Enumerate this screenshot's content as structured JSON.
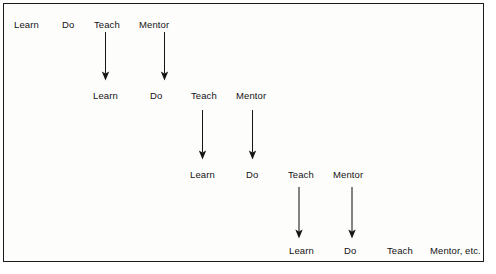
{
  "diagram": {
    "background_color": "#fdfdfc",
    "border_color": "#1b1b1b",
    "text_color": "#141414",
    "arrow_color": "#151515",
    "stage": {
      "width": 496,
      "height": 274
    },
    "frame": {
      "x": 3,
      "y": 3,
      "width": 481,
      "height": 259
    },
    "rows": [
      {
        "index": 1,
        "y": 19,
        "nodes": [
          {
            "label": "Learn",
            "x": 14
          },
          {
            "label": "Do",
            "x": 62
          },
          {
            "label": "Teach",
            "x": 94
          },
          {
            "label": "Mentor",
            "x": 139
          }
        ]
      },
      {
        "index": 2,
        "y": 90,
        "nodes": [
          {
            "label": "Learn",
            "x": 93
          },
          {
            "label": "Do",
            "x": 150
          },
          {
            "label": "Teach",
            "x": 191
          },
          {
            "label": "Mentor",
            "x": 236
          }
        ]
      },
      {
        "index": 3,
        "y": 169,
        "nodes": [
          {
            "label": "Learn",
            "x": 190
          },
          {
            "label": "Do",
            "x": 246
          },
          {
            "label": "Teach",
            "x": 288
          },
          {
            "label": "Mentor",
            "x": 333
          }
        ]
      },
      {
        "index": 4,
        "y": 245,
        "nodes": [
          {
            "label": "Learn",
            "x": 289
          },
          {
            "label": "Do",
            "x": 344
          },
          {
            "label": "Teach",
            "x": 387
          },
          {
            "label": "Mentor, etc.",
            "x": 430
          }
        ]
      }
    ],
    "arrows": [
      {
        "from": "row1-teach",
        "to": "row2-learn",
        "x": 105.5,
        "y1": 32,
        "y2": 80
      },
      {
        "from": "row1-mentor",
        "to": "row2-do",
        "x": 164.5,
        "y1": 32,
        "y2": 80
      },
      {
        "from": "row2-teach",
        "to": "row3-learn",
        "x": 202.5,
        "y1": 110,
        "y2": 159
      },
      {
        "from": "row2-mentor",
        "to": "row3-do",
        "x": 252.5,
        "y1": 110,
        "y2": 159
      },
      {
        "from": "row3-teach",
        "to": "row4-learn",
        "x": 299.0,
        "y1": 187,
        "y2": 238
      },
      {
        "from": "row3-mentor",
        "to": "row4-do",
        "x": 352.0,
        "y1": 187,
        "y2": 238
      }
    ]
  }
}
